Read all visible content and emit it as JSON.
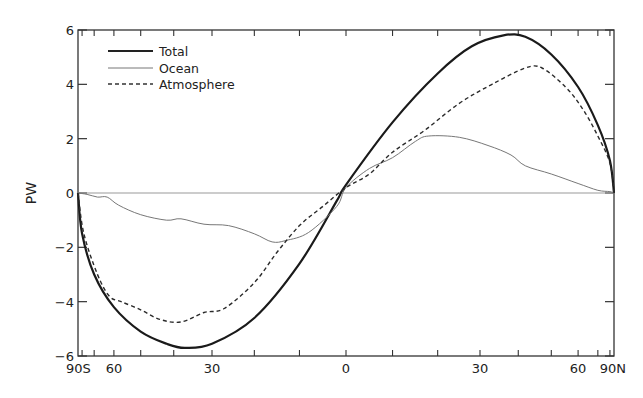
{
  "chart_data": {
    "type": "line",
    "title": "",
    "xlabel": "",
    "ylabel": "PW",
    "ylim": [
      -6,
      6
    ],
    "xlim": [
      -90,
      90
    ],
    "x_scale": "sine of latitude",
    "y_ticks": [
      -6,
      -4,
      -2,
      0,
      2,
      4,
      6
    ],
    "y_tick_labels": [
      "-6",
      "-4",
      "-2",
      "0",
      "2",
      "4",
      "6"
    ],
    "x_tick_labels": [
      {
        "lat": -90,
        "label": "90S"
      },
      {
        "lat": -60,
        "label": "60"
      },
      {
        "lat": -30,
        "label": "30"
      },
      {
        "lat": 0,
        "label": "0"
      },
      {
        "lat": 30,
        "label": "30"
      },
      {
        "lat": 60,
        "label": "60"
      },
      {
        "lat": 90,
        "label": "90N"
      }
    ],
    "x_minor_ticks": [
      -80,
      -70,
      -60,
      -50,
      -40,
      -30,
      -20,
      -10,
      0,
      10,
      20,
      30,
      40,
      50,
      60,
      70,
      80
    ],
    "zero_line": true,
    "grid": false,
    "legend_position": "upper left",
    "series": [
      {
        "name": "Total",
        "style": "solid-thick",
        "points": [
          [
            -90,
            0
          ],
          [
            -80,
            -1.5
          ],
          [
            -70,
            -3.0
          ],
          [
            -60,
            -4.2
          ],
          [
            -50,
            -5.1
          ],
          [
            -42,
            -5.55
          ],
          [
            -37,
            -5.7
          ],
          [
            -30,
            -5.55
          ],
          [
            -20,
            -4.6
          ],
          [
            -10,
            -2.6
          ],
          [
            -2,
            -0.3
          ],
          [
            0,
            0.3
          ],
          [
            10,
            2.6
          ],
          [
            20,
            4.4
          ],
          [
            28,
            5.4
          ],
          [
            36,
            5.8
          ],
          [
            42,
            5.75
          ],
          [
            50,
            5.1
          ],
          [
            60,
            3.9
          ],
          [
            70,
            2.5
          ],
          [
            80,
            1.2
          ],
          [
            90,
            0
          ]
        ]
      },
      {
        "name": "Ocean",
        "style": "solid-thin",
        "points": [
          [
            -90,
            0
          ],
          [
            -75,
            -0.05
          ],
          [
            -68,
            -0.15
          ],
          [
            -63,
            -0.15
          ],
          [
            -58,
            -0.45
          ],
          [
            -50,
            -0.8
          ],
          [
            -42,
            -1.0
          ],
          [
            -38,
            -0.95
          ],
          [
            -32,
            -1.15
          ],
          [
            -26,
            -1.2
          ],
          [
            -20,
            -1.5
          ],
          [
            -16,
            -1.8
          ],
          [
            -13,
            -1.75
          ],
          [
            -8,
            -1.45
          ],
          [
            -2,
            -0.5
          ],
          [
            0,
            0.2
          ],
          [
            5,
            0.9
          ],
          [
            10,
            1.3
          ],
          [
            15,
            1.9
          ],
          [
            18,
            2.1
          ],
          [
            25,
            2.05
          ],
          [
            32,
            1.75
          ],
          [
            38,
            1.4
          ],
          [
            42,
            1.0
          ],
          [
            50,
            0.7
          ],
          [
            60,
            0.35
          ],
          [
            70,
            0.1
          ],
          [
            80,
            0.05
          ],
          [
            90,
            0
          ]
        ]
      },
      {
        "name": "Atmosphere",
        "style": "dashed",
        "points": [
          [
            -90,
            0
          ],
          [
            -78,
            -1.5
          ],
          [
            -68,
            -3.0
          ],
          [
            -62,
            -3.8
          ],
          [
            -57,
            -4.0
          ],
          [
            -50,
            -4.3
          ],
          [
            -44,
            -4.65
          ],
          [
            -38,
            -4.75
          ],
          [
            -32,
            -4.4
          ],
          [
            -27,
            -4.25
          ],
          [
            -20,
            -3.3
          ],
          [
            -15,
            -2.2
          ],
          [
            -10,
            -1.2
          ],
          [
            -5,
            -0.5
          ],
          [
            0,
            0.2
          ],
          [
            5,
            0.7
          ],
          [
            10,
            1.5
          ],
          [
            17,
            2.3
          ],
          [
            25,
            3.3
          ],
          [
            33,
            4.0
          ],
          [
            42,
            4.6
          ],
          [
            47,
            4.6
          ],
          [
            55,
            3.9
          ],
          [
            62,
            3.1
          ],
          [
            70,
            2.1
          ],
          [
            80,
            1.1
          ],
          [
            90,
            0
          ]
        ]
      }
    ]
  },
  "legend": {
    "items": [
      {
        "label": "Total"
      },
      {
        "label": "Ocean"
      },
      {
        "label": "Atmosphere"
      }
    ]
  }
}
